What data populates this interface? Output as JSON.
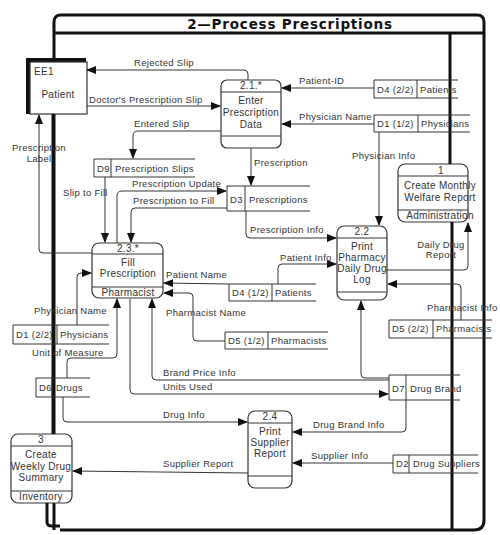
{
  "diagram": {
    "title": "2—Process Prescriptions",
    "external_entities": [
      {
        "id": "EE1",
        "name": "Patient"
      }
    ],
    "processes": [
      {
        "id": "2.1.*",
        "name_lines": [
          "Enter",
          "Prescription",
          "Data"
        ],
        "actor": ""
      },
      {
        "id": "2.2",
        "name_lines": [
          "Print",
          "Pharmacy",
          "Daily Drug",
          "Log"
        ],
        "actor": ""
      },
      {
        "id": "2.3.*",
        "name_lines": [
          "Fill",
          "Prescription"
        ],
        "actor": "Pharmacist"
      },
      {
        "id": "2.4",
        "name_lines": [
          "Print",
          "Supplier",
          "Report"
        ],
        "actor": ""
      },
      {
        "id": "1",
        "name_lines": [
          "Create Monthly",
          "Welfare Report"
        ],
        "actor": "Administration"
      },
      {
        "id": "3",
        "name_lines": [
          "Create",
          "Weekly Drug",
          "Summary"
        ],
        "actor": "Inventory"
      }
    ],
    "data_stores": [
      {
        "id": "D4 (2/2)",
        "name": "Patients"
      },
      {
        "id": "D1 (1/2)",
        "name": "Physicians"
      },
      {
        "id": "D9",
        "name": "Prescription Slips"
      },
      {
        "id": "D3",
        "name": "Prescriptions"
      },
      {
        "id": "D4 (1/2)",
        "name": "Patients"
      },
      {
        "id": "D5 (1/2)",
        "name": "Pharmacists"
      },
      {
        "id": "D5 (2/2)",
        "name": "Pharmacists"
      },
      {
        "id": "D1 (2/2)",
        "name": "Physicians"
      },
      {
        "id": "D6",
        "name": "Drugs"
      },
      {
        "id": "D7",
        "name": "Drug Brand"
      },
      {
        "id": "D2",
        "name": "Drug Suppliers"
      }
    ],
    "flows": {
      "rejected_slip": "Rejected Slip",
      "doctors_prescription_slip": "Doctor's Prescription Slip",
      "entered_slip": "Entered Slip",
      "patient_id": "Patient-ID",
      "physician_name_top": "Physician Name",
      "prescription": "Prescription",
      "physician_info": "Physician Info",
      "prescription_label": [
        "Prescription",
        "Label"
      ],
      "slip_to_fill": "Slip to Fill",
      "prescription_update": "Prescription Update",
      "prescription_to_fill": "Prescription to Fill",
      "prescription_info": "Prescription Info",
      "patient_info": "Patient Info",
      "patient_name": "Patient Name",
      "pharmacist_name": "Pharmacist Name",
      "daily_drug_report": [
        "Daily Drug",
        "Report"
      ],
      "pharmacist_info": "Pharmacist Info",
      "physician_name_left": "Physician Name",
      "unit_of_measure": "Unit of Measure",
      "brand_price_info": "Brand Price Info",
      "units_used": "Units Used",
      "drug_info": "Drug Info",
      "drug_brand_info": "Drug Brand Info",
      "supplier_info": "Supplier Info",
      "supplier_report": "Supplier Report"
    }
  }
}
